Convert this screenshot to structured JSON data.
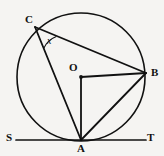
{
  "figure": {
    "type": "circle-geometry-diagram",
    "background_color": "#f5f4f2",
    "stroke_color": "#111111",
    "width": 164,
    "height": 156,
    "labels": {
      "center": "O",
      "point_a": "A",
      "point_b": "B",
      "point_c": "C",
      "tangent_start": "S",
      "tangent_end": "T",
      "angle": "x"
    },
    "geometry": {
      "circle": {
        "cx": 81,
        "cy": 77,
        "r": 64
      },
      "points": {
        "O": {
          "x": 81,
          "y": 77
        },
        "A": {
          "x": 81,
          "y": 140
        },
        "B": {
          "x": 146,
          "y": 73
        },
        "C": {
          "x": 35,
          "y": 27
        },
        "S": {
          "x": 18,
          "y": 140
        },
        "T": {
          "x": 146,
          "y": 140
        }
      },
      "segments": [
        {
          "name": "CB",
          "from": "C",
          "to": "B"
        },
        {
          "name": "CA",
          "from": "C",
          "to": "A"
        },
        {
          "name": "OB",
          "from": "O",
          "to": "B"
        },
        {
          "name": "OA",
          "from": "O",
          "to": "A"
        },
        {
          "name": "AB",
          "from": "A",
          "to": "B"
        },
        {
          "name": "ST",
          "from": "S",
          "to": "T"
        }
      ],
      "angle_marks": [
        {
          "name": "angle-x-at-C",
          "vertex": "C",
          "between": [
            "CB",
            "CA"
          ]
        }
      ]
    },
    "label_positions": {
      "O": {
        "left": 69,
        "top": 62
      },
      "A": {
        "left": 77,
        "top": 143
      },
      "B": {
        "left": 151,
        "top": 67
      },
      "C": {
        "left": 25,
        "top": 14
      },
      "S": {
        "left": 6,
        "top": 132
      },
      "T": {
        "left": 147,
        "top": 132
      },
      "x": {
        "left": 47,
        "top": 36
      }
    }
  }
}
